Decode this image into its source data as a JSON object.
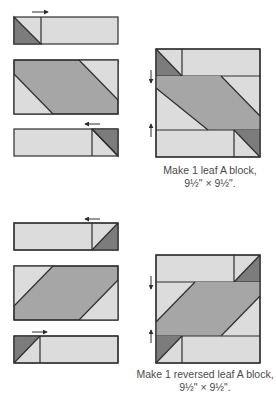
{
  "colors": {
    "light_fabric": "#dcdcdc",
    "medium_fabric": "#a6a6a6",
    "dark_fabric": "#7c7c7c",
    "outline": "#2e2e2e",
    "caption_text": "#4a4a4a"
  },
  "leaf_a": {
    "caption_line1": "Make 1 leaf A block,",
    "caption_line2": "9½\" × 9½\".",
    "units": [
      "top strip with dark corner triangle (pressed right)",
      "center parallelogram rectangle",
      "bottom strip with dark corner triangle (pressed left)"
    ]
  },
  "reversed_leaf_a": {
    "caption_line1": "Make 1 reversed leaf A block,",
    "caption_line2": "9½\" × 9½\".",
    "units": [
      "top strip with dark corner triangle (pressed left)",
      "center parallelogram rectangle",
      "bottom strip with dark corner triangle (pressed right)"
    ]
  }
}
